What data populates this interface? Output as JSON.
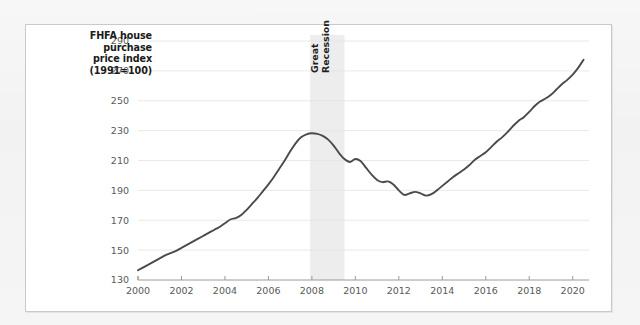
{
  "figure": {
    "axis_title_lines": [
      "FHFA house",
      "purchase",
      "price index",
      "(1991=100)"
    ],
    "annotation": {
      "line1": "Great",
      "line2": "Recession"
    },
    "colors": {
      "line": "#4a4a4a",
      "gridline": "#e3e3e3",
      "axis": "#9a9a9a",
      "band": "#ededed",
      "panel_background": "#ffffff",
      "page_background": "#f4f4f4"
    }
  },
  "chart_data": {
    "type": "line",
    "title": "FHFA house purchase price index (1991=100)",
    "xlabel": "",
    "ylabel": "FHFA house purchase price index (1991=100)",
    "xlim": [
      2000,
      2020.75
    ],
    "ylim": [
      130,
      290
    ],
    "yticks": [
      130,
      150,
      170,
      190,
      210,
      230,
      250,
      270,
      290
    ],
    "xticks": [
      2000,
      2002,
      2004,
      2006,
      2008,
      2010,
      2012,
      2014,
      2016,
      2018,
      2020
    ],
    "grid": "horizontal",
    "legend": "none",
    "annotations": [
      {
        "text": "Great Recession",
        "type": "shaded-span",
        "x_start": 2007.92,
        "x_end": 2009.5,
        "color": "#ededed"
      }
    ],
    "series": [
      {
        "name": "FHFA house purchase price index",
        "x": [
          2000.0,
          2000.25,
          2000.5,
          2000.75,
          2001.0,
          2001.25,
          2001.5,
          2001.75,
          2002.0,
          2002.25,
          2002.5,
          2002.75,
          2003.0,
          2003.25,
          2003.5,
          2003.75,
          2004.0,
          2004.25,
          2004.5,
          2004.75,
          2005.0,
          2005.25,
          2005.5,
          2005.75,
          2006.0,
          2006.25,
          2006.5,
          2006.75,
          2007.0,
          2007.25,
          2007.5,
          2007.75,
          2008.0,
          2008.25,
          2008.5,
          2008.75,
          2009.0,
          2009.25,
          2009.5,
          2009.75,
          2010.0,
          2010.25,
          2010.5,
          2010.75,
          2011.0,
          2011.25,
          2011.5,
          2011.75,
          2012.0,
          2012.25,
          2012.5,
          2012.75,
          2013.0,
          2013.25,
          2013.5,
          2013.75,
          2014.0,
          2014.25,
          2014.5,
          2014.75,
          2015.0,
          2015.25,
          2015.5,
          2015.75,
          2016.0,
          2016.25,
          2016.5,
          2016.75,
          2017.0,
          2017.25,
          2017.5,
          2017.75,
          2018.0,
          2018.25,
          2018.5,
          2018.75,
          2019.0,
          2019.25,
          2019.5,
          2019.75,
          2020.0,
          2020.25,
          2020.5
        ],
        "y": [
          136.5,
          138.5,
          140.5,
          142.5,
          144.5,
          146.5,
          148.0,
          149.5,
          151.5,
          153.5,
          155.5,
          157.5,
          159.5,
          161.5,
          163.5,
          165.5,
          168.0,
          170.5,
          171.5,
          173.5,
          177.0,
          181.0,
          185.0,
          189.5,
          194.0,
          199.0,
          204.5,
          210.0,
          216.0,
          221.5,
          225.5,
          227.5,
          228.2,
          227.8,
          226.5,
          224.0,
          220.0,
          215.0,
          211.0,
          209.0,
          211.0,
          209.5,
          205.0,
          200.5,
          197.0,
          195.5,
          196.0,
          194.0,
          190.0,
          187.0,
          188.0,
          189.0,
          188.0,
          186.5,
          187.5,
          190.0,
          193.0,
          196.0,
          199.0,
          201.5,
          204.0,
          207.0,
          210.5,
          213.0,
          215.5,
          219.0,
          222.5,
          225.5,
          229.0,
          233.0,
          236.5,
          239.0,
          242.5,
          246.5,
          249.5,
          251.5,
          254.0,
          257.5,
          261.0,
          264.0,
          267.5,
          272.0,
          277.5
        ]
      }
    ]
  }
}
